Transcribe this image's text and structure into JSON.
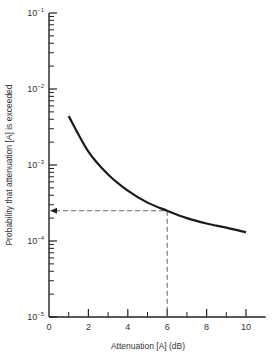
{
  "chart_data": {
    "type": "line",
    "title": "",
    "xlabel": "Attenuation [A] (dB)",
    "ylabel": "Probability that attenuation [A] is exceeded",
    "xscale": "linear",
    "yscale": "log",
    "xlim": [
      0,
      11
    ],
    "ylim": [
      1e-05,
      0.1
    ],
    "x_ticks": [
      0,
      2,
      4,
      6,
      8,
      10
    ],
    "x_minor_ticks": [
      1,
      3,
      5,
      7,
      9
    ],
    "y_ticks": [
      "10^-1",
      "10^-2",
      "10^-3",
      "10^-4",
      "10^-5"
    ],
    "grid": false,
    "legend": null,
    "series": [
      {
        "name": "Exceedance probability",
        "x": [
          1,
          2,
          3,
          4,
          5,
          6,
          7,
          8,
          9,
          10
        ],
        "values": [
          0.0044,
          0.0015,
          0.00075,
          0.00046,
          0.00032,
          0.00025,
          0.0002,
          0.00017,
          0.00015,
          0.00013
        ]
      }
    ],
    "annotations": [
      {
        "type": "dashed-guide",
        "x": 6,
        "y": 0.00025,
        "description": "Dashed lines from curve at 6 dB to y-axis (arrow) and to x-axis"
      }
    ]
  },
  "axes": {
    "x_title": "Attenuation [A] (dB)",
    "y_title": "Probability that attenuation [A] is exceeded",
    "x_tick_labels": [
      "0",
      "2",
      "4",
      "6",
      "8",
      "10"
    ],
    "y_tick_labels": [
      {
        "base": "10",
        "exp": "−1"
      },
      {
        "base": "10",
        "exp": "−2"
      },
      {
        "base": "10",
        "exp": "−3"
      },
      {
        "base": "10",
        "exp": "−4"
      },
      {
        "base": "10",
        "exp": "−5"
      }
    ]
  }
}
